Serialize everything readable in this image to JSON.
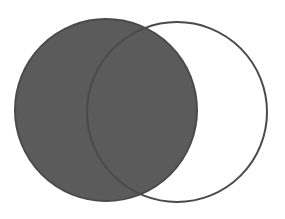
{
  "diagram": {
    "type": "venn",
    "sets": [
      {
        "id": "A",
        "shaded": true,
        "cx": 106,
        "cy": 110,
        "r": 91
      },
      {
        "id": "B",
        "shaded": false,
        "cx": 177,
        "cy": 112,
        "r": 90
      }
    ],
    "colors": {
      "fill": "#5b5b5b",
      "stroke": "#4a4a4a",
      "background": "#ffffff"
    }
  }
}
